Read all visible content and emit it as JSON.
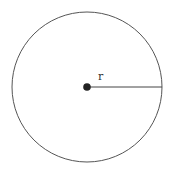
{
  "diagram": {
    "type": "circle-radius",
    "center_point": {
      "x": 87,
      "y": 87,
      "label": ""
    },
    "circle_radius_px": 75,
    "radius_label": "r",
    "colors": {
      "circle_stroke": "#555555",
      "radius_line": "#444444",
      "center_dot": "#222222",
      "background": "#ffffff"
    }
  }
}
